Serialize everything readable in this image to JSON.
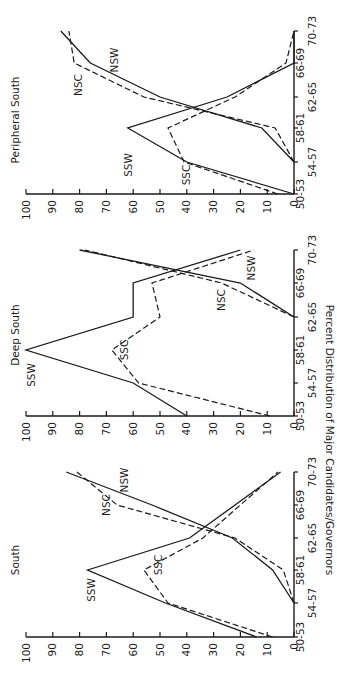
{
  "figure": {
    "ylabel": "Percent Distribution of Major Candidates/Governors"
  },
  "chart_data": [
    {
      "type": "line",
      "title": "South",
      "xlabel": "",
      "ylabel": "Percent Distribution of Major Candidates/Governors",
      "categories": [
        "50-53",
        "54-57",
        "58-61",
        "62-65",
        "66-69",
        "70-73"
      ],
      "ylim": [
        0,
        100
      ],
      "yticks": [
        0,
        10,
        20,
        30,
        40,
        50,
        60,
        70,
        80,
        90,
        100
      ],
      "grid": false,
      "series": [
        {
          "name": "SSW",
          "style": "solid",
          "values": [
            14,
            48,
            77,
            39,
            22,
            5
          ]
        },
        {
          "name": "SSC",
          "style": "dashed",
          "values": [
            8,
            47,
            56,
            34,
            20,
            6
          ]
        },
        {
          "name": "NSW",
          "style": "solid",
          "values": [
            null,
            0,
            8,
            23,
            53,
            85
          ]
        },
        {
          "name": "NSC",
          "style": "dashed",
          "values": [
            null,
            0,
            4,
            22,
            66,
            81
          ]
        }
      ]
    },
    {
      "type": "line",
      "title": "Deep South",
      "xlabel": "",
      "ylabel": "",
      "categories": [
        "50-53",
        "54-57",
        "58-61",
        "62-65",
        "66-69",
        "70-73"
      ],
      "ylim": [
        0,
        100
      ],
      "yticks": [
        0,
        10,
        20,
        30,
        40,
        50,
        60,
        70,
        80,
        90,
        100
      ],
      "grid": false,
      "series": [
        {
          "name": "SSW",
          "style": "solid",
          "values": [
            40,
            60,
            100,
            60,
            60,
            20
          ]
        },
        {
          "name": "SSC",
          "style": "dashed",
          "values": [
            9,
            58,
            68,
            50,
            53,
            15
          ]
        },
        {
          "name": "NSW",
          "style": "solid",
          "values": [
            null,
            null,
            null,
            0,
            20,
            80
          ]
        },
        {
          "name": "NSC",
          "style": "dashed",
          "values": [
            null,
            null,
            null,
            0,
            27,
            78
          ]
        }
      ]
    },
    {
      "type": "line",
      "title": "Peripheral South",
      "xlabel": "",
      "ylabel": "",
      "categories": [
        "50-53",
        "54-57",
        "58-61",
        "62-65",
        "66-69",
        "70-73"
      ],
      "ylim": [
        0,
        100
      ],
      "yticks": [
        0,
        10,
        20,
        30,
        40,
        50,
        60,
        70,
        80,
        90,
        100
      ],
      "grid": false,
      "series": [
        {
          "name": "SSW",
          "style": "solid",
          "values": [
            0,
            40,
            62,
            25,
            0,
            0
          ]
        },
        {
          "name": "SSC",
          "style": "dashed",
          "values": [
            6,
            41,
            47,
            22,
            3,
            0
          ]
        },
        {
          "name": "NSW",
          "style": "solid",
          "values": [
            null,
            0,
            12,
            50,
            76,
            87
          ]
        },
        {
          "name": "NSC",
          "style": "dashed",
          "values": [
            null,
            0,
            7,
            56,
            82,
            84
          ]
        }
      ]
    }
  ]
}
